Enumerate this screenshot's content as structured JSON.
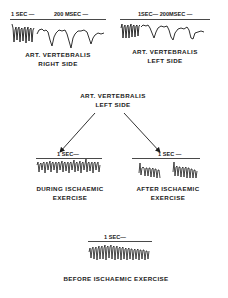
{
  "panels": {
    "top_left": {
      "scale_1": "1 SEC —",
      "scale_2": "200 MSEC —",
      "title": "ART. VERTEBRALIS",
      "subtitle": "RIGHT SIDE"
    },
    "top_right": {
      "scale_1": "1SEC— 200MSEC —",
      "title": "ART. VERTEBRALIS",
      "subtitle": "LEFT SIDE"
    },
    "center": {
      "title": "ART. VERTEBRALIS",
      "subtitle": "LEFT SIDE"
    },
    "mid_left": {
      "scale": "1 SEC—",
      "title": "DURING ISCHAEMIC",
      "subtitle": "EXERCISE"
    },
    "mid_right": {
      "scale": "1 SEC —",
      "title": "AFTER ISCHAEMIC",
      "subtitle": "EXERCISE"
    },
    "bottom": {
      "scale": "1 SEC—",
      "title": "BEFORE ISCHAEMIC EXERCISE"
    }
  },
  "colors": {
    "ink": "#1a1a1a",
    "background": "#ffffff"
  }
}
